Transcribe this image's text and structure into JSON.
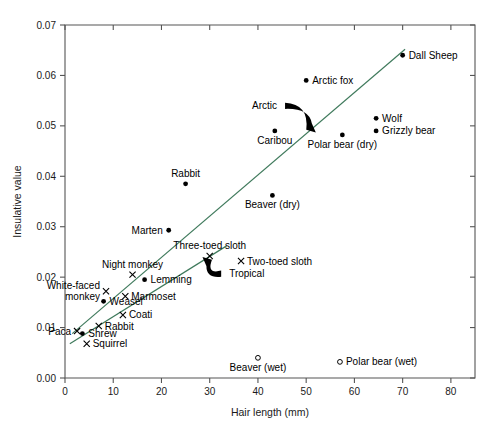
{
  "chart_data": {
    "type": "scatter",
    "title": "",
    "xlabel": "Hair length (mm)",
    "ylabel": "Insulative value",
    "xlim": [
      0,
      85
    ],
    "ylim": [
      0.0,
      0.07
    ],
    "xticks": [
      "0",
      "10",
      "20",
      "30",
      "40",
      "50",
      "60",
      "70",
      "80"
    ],
    "xtick_values": [
      0,
      10,
      20,
      30,
      40,
      50,
      60,
      70,
      80
    ],
    "yticks": [
      "0.00",
      "0.01",
      "0.02",
      "0.03",
      "0.04",
      "0.05",
      "0.06",
      "0.07"
    ],
    "ytick_values": [
      0.0,
      0.01,
      0.02,
      0.03,
      0.04,
      0.05,
      0.06,
      0.07
    ],
    "grid": false,
    "legend": "none",
    "accent_color": "#3f7a5c",
    "series": [
      {
        "name": "Arctic (dry)",
        "marker": "filled-circle",
        "points": [
          {
            "label": "Dall Sheep",
            "x": 70.0,
            "y": 0.064,
            "label_pos": "right"
          },
          {
            "label": "Arctic fox",
            "x": 50.0,
            "y": 0.059,
            "label_pos": "right"
          },
          {
            "label": "Wolf",
            "x": 64.5,
            "y": 0.0515,
            "label_pos": "right"
          },
          {
            "label": "Grizzly bear",
            "x": 64.5,
            "y": 0.049,
            "label_pos": "right"
          },
          {
            "label": "Polar bear (dry)",
            "x": 57.5,
            "y": 0.0482,
            "label_pos": "below"
          },
          {
            "label": "Caribou",
            "x": 43.5,
            "y": 0.049,
            "label_pos": "below"
          },
          {
            "label": "Rabbit",
            "x": 25.0,
            "y": 0.0385,
            "label_pos": "above"
          },
          {
            "label": "Beaver (dry)",
            "x": 43.0,
            "y": 0.0362,
            "label_pos": "below"
          },
          {
            "label": "Marten",
            "x": 21.5,
            "y": 0.0293,
            "label_pos": "left"
          },
          {
            "label": "Lemming",
            "x": 16.5,
            "y": 0.0195,
            "label_pos": "right"
          },
          {
            "label": "Weasel",
            "x": 8.0,
            "y": 0.0152,
            "label_pos": "right"
          },
          {
            "label": "Shrew",
            "x": 3.6,
            "y": 0.0088,
            "label_pos": "right"
          }
        ]
      },
      {
        "name": "Tropical",
        "marker": "cross",
        "points": [
          {
            "label": "Three-toed sloth",
            "x": 30.0,
            "y": 0.0242,
            "label_pos": "above"
          },
          {
            "label": "Two-toed sloth",
            "x": 36.5,
            "y": 0.0232,
            "label_pos": "right"
          },
          {
            "label": "Night monkey",
            "x": 14.0,
            "y": 0.0205,
            "label_pos": "above"
          },
          {
            "label": "White-faced monkey",
            "x": 8.5,
            "y": 0.0172,
            "label_pos": "left"
          },
          {
            "label": "Marmoset",
            "x": 12.5,
            "y": 0.0162,
            "label_pos": "right"
          },
          {
            "label": "Coati",
            "x": 12.0,
            "y": 0.0125,
            "label_pos": "right"
          },
          {
            "label": "Rabbit",
            "x": 7.0,
            "y": 0.0103,
            "label_pos": "right"
          },
          {
            "label": "Paca",
            "x": 2.5,
            "y": 0.0093,
            "label_pos": "left"
          },
          {
            "label": "Squirrel",
            "x": 4.5,
            "y": 0.0068,
            "label_pos": "right"
          }
        ]
      },
      {
        "name": "Wet",
        "marker": "open-circle",
        "points": [
          {
            "label": "Beaver (wet)",
            "x": 40.0,
            "y": 0.004,
            "label_pos": "below"
          },
          {
            "label": "Polar bear (wet)",
            "x": 57.0,
            "y": 0.0032,
            "label_pos": "right"
          }
        ]
      }
    ],
    "trend_lines": [
      {
        "name": "arctic-trend",
        "color": "#3f7a5c",
        "x1": 1.5,
        "y1": 0.0088,
        "x2": 70.5,
        "y2": 0.0652
      },
      {
        "name": "tropical-trend",
        "color": "#3f7a5c",
        "x1": 1.0,
        "y1": 0.0068,
        "x2": 33.5,
        "y2": 0.0262
      }
    ],
    "annotations": [
      {
        "name": "arctic",
        "label": "Arctic",
        "label_x": 45.0,
        "label_y": 0.054,
        "target_x": 52.0,
        "target_y": 0.0487
      },
      {
        "name": "tropical",
        "label": "Tropical",
        "label_x": 33.0,
        "label_y": 0.0207,
        "target_x": 28.5,
        "target_y": 0.024
      }
    ]
  }
}
